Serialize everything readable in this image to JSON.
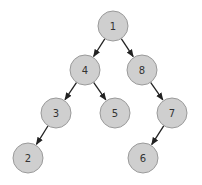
{
  "diagram": {
    "type": "binary-tree",
    "style": {
      "node_fill": "#cfcfcf",
      "node_stroke": "#9a9a9a",
      "edge_color": "#222222",
      "label_color": "#333333",
      "node_radius": 15
    },
    "nodes": [
      {
        "id": "n1",
        "label": "1",
        "x": 113,
        "y": 26
      },
      {
        "id": "n4",
        "label": "4",
        "x": 85,
        "y": 70
      },
      {
        "id": "n8",
        "label": "8",
        "x": 142,
        "y": 70
      },
      {
        "id": "n3",
        "label": "3",
        "x": 56,
        "y": 113
      },
      {
        "id": "n5",
        "label": "5",
        "x": 115,
        "y": 113
      },
      {
        "id": "n7",
        "label": "7",
        "x": 172,
        "y": 113
      },
      {
        "id": "n2",
        "label": "2",
        "x": 28,
        "y": 158
      },
      {
        "id": "n6",
        "label": "6",
        "x": 143,
        "y": 158
      }
    ],
    "edges": [
      {
        "from": "n1",
        "to": "n4"
      },
      {
        "from": "n1",
        "to": "n8"
      },
      {
        "from": "n4",
        "to": "n3"
      },
      {
        "from": "n4",
        "to": "n5"
      },
      {
        "from": "n8",
        "to": "n7"
      },
      {
        "from": "n3",
        "to": "n2"
      },
      {
        "from": "n7",
        "to": "n6"
      }
    ]
  }
}
